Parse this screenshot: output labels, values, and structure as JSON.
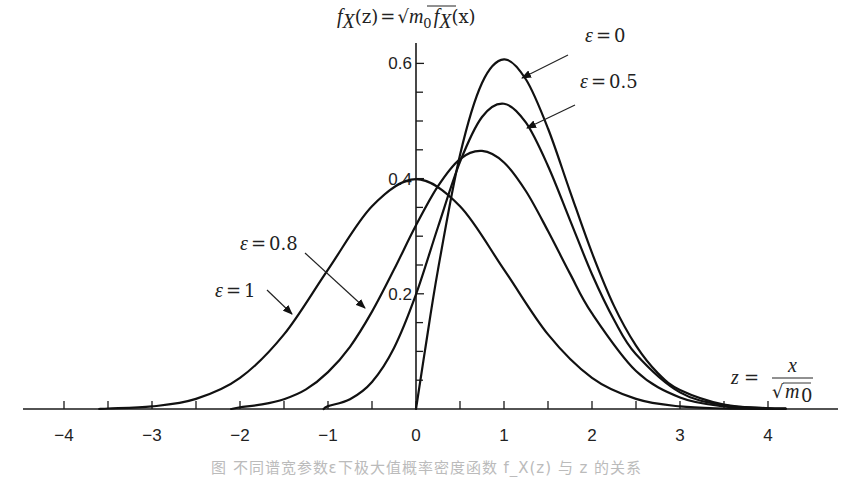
{
  "figure": {
    "title_parts": {
      "f": "f",
      "sub": "X",
      "arg_z": "(z)",
      "eq": "=",
      "sqrt": "√",
      "m": "m",
      "m_sub": "0",
      "f2": "f",
      "sub2": "X",
      "arg_x": "(x)"
    },
    "xlabel": "z = x / √m₀",
    "xlabel_parts": {
      "z": "z",
      "eq": "=",
      "num": "x",
      "sqrt": "√",
      "m": "m",
      "m_sub": "0"
    },
    "caption": "图  不同谱宽参数ε下极大值概率密度函数 f_X(z) 与 z 的关系"
  },
  "chart_data": {
    "type": "line",
    "xlabel": "z = x/√m₀",
    "ylabel": "f_X(z)",
    "xlim": [
      -4.4,
      4.8
    ],
    "ylim": [
      0,
      0.64
    ],
    "grid": false,
    "legend": "annotations",
    "x_ticks": [
      -4,
      -3,
      -2,
      -1,
      0,
      1,
      2,
      3,
      4
    ],
    "x_tick_labels": [
      "−4",
      "−3",
      "−2",
      "−1",
      "0",
      "1",
      "2",
      "3",
      "4"
    ],
    "x_minor_ticks": [
      -3.5,
      -2.5,
      -1.5,
      -0.5,
      0.5,
      1.5,
      2.5,
      3.5
    ],
    "y_ticks": [
      0.2,
      0.4,
      0.6
    ],
    "y_tick_labels": [
      "0.2",
      "0.4",
      "0.6"
    ],
    "y_minor_ticks": [
      0.05,
      0.1,
      0.15,
      0.25,
      0.3,
      0.35,
      0.45,
      0.5,
      0.55
    ],
    "series": [
      {
        "name": "ε=0",
        "label_parts": {
          "eps": "ε",
          "eq": "=",
          "val": "0"
        },
        "x": [
          0,
          0.1,
          0.25,
          0.5,
          0.75,
          1.0,
          1.25,
          1.5,
          1.75,
          2.0,
          2.25,
          2.5,
          2.75,
          3.0,
          3.5,
          4.0,
          4.2
        ],
        "y": [
          0,
          0.0995,
          0.242,
          0.441,
          0.566,
          0.607,
          0.572,
          0.487,
          0.378,
          0.271,
          0.179,
          0.11,
          0.062,
          0.033,
          0.0076,
          0.0013,
          0.0006
        ],
        "label_pos": [
          585,
          42
        ],
        "arrow_from": [
          568,
          55
        ],
        "arrow_to": [
          522,
          78
        ]
      },
      {
        "name": "ε=0.5",
        "label_parts": {
          "eps": "ε",
          "eq": "=",
          "val": "0.5"
        },
        "x": [
          -1.05,
          -1.0,
          -0.75,
          -0.5,
          -0.25,
          0,
          0.25,
          0.5,
          0.75,
          1.0,
          1.25,
          1.5,
          1.75,
          2.0,
          2.25,
          2.5,
          3.0,
          3.5,
          4.0,
          4.2
        ],
        "y": [
          0,
          0.005,
          0.017,
          0.047,
          0.106,
          0.199,
          0.316,
          0.429,
          0.507,
          0.53,
          0.497,
          0.422,
          0.328,
          0.234,
          0.155,
          0.095,
          0.0288,
          0.0066,
          0.0012,
          0.0005
        ],
        "label_pos": [
          580,
          88
        ],
        "arrow_from": [
          575,
          105
        ],
        "arrow_to": [
          527,
          128
        ]
      },
      {
        "name": "ε=0.8",
        "label_parts": {
          "eps": "ε",
          "eq": "=",
          "val": "0.8"
        },
        "x": [
          -2.1,
          -2.0,
          -1.75,
          -1.5,
          -1.25,
          -1.0,
          -0.75,
          -0.5,
          -0.25,
          0,
          0.25,
          0.5,
          0.75,
          1.0,
          1.25,
          1.5,
          1.75,
          2.0,
          2.5,
          3.0,
          3.5,
          4.0,
          4.2
        ],
        "y": [
          0,
          0.003,
          0.008,
          0.017,
          0.034,
          0.064,
          0.108,
          0.169,
          0.242,
          0.319,
          0.387,
          0.434,
          0.448,
          0.428,
          0.378,
          0.309,
          0.235,
          0.166,
          0.066,
          0.02,
          0.0046,
          0.0008,
          0.0004
        ],
        "label_pos": [
          240,
          250
        ],
        "arrow_from": [
          305,
          253
        ],
        "arrow_to": [
          365,
          308
        ]
      },
      {
        "name": "ε=1",
        "label_parts": {
          "eps": "ε",
          "eq": "=",
          "val": "1"
        },
        "x": [
          -3.6,
          -3.5,
          -3.0,
          -2.5,
          -2.0,
          -1.5,
          -1.0,
          -0.5,
          0,
          0.5,
          1.0,
          1.5,
          2.0,
          2.5,
          3.0,
          3.5,
          4.0
        ],
        "y": [
          0,
          0.0009,
          0.0044,
          0.0175,
          0.054,
          0.1295,
          0.242,
          0.352,
          0.399,
          0.352,
          0.242,
          0.1295,
          0.054,
          0.0175,
          0.0044,
          0.0009,
          0.0001
        ],
        "label_pos": [
          215,
          297
        ],
        "arrow_from": [
          267,
          290
        ],
        "arrow_to": [
          292,
          314
        ]
      }
    ]
  },
  "style": {
    "curve_color": "#111111",
    "axis_color": "#1a1a1a",
    "background": "#ffffff"
  }
}
